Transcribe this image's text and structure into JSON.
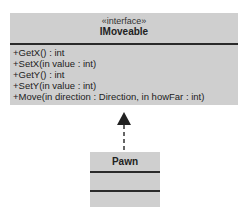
{
  "interface_class": {
    "stereotype": "«interface»",
    "name": "IMoveable",
    "operations": [
      "+GetX() : int",
      "+SetX(in value : int)",
      "+GetY() : int",
      "+SetY(in value : int)",
      "+Move(in direction : Direction, in howFar : int)"
    ]
  },
  "implementing_class": {
    "name": "Pawn"
  },
  "relationship": "realization"
}
